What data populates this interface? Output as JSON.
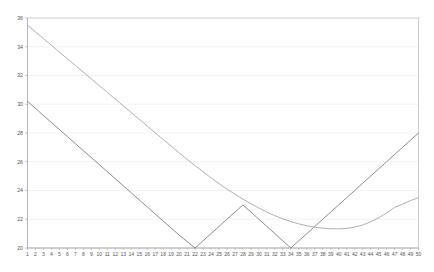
{
  "chart_data": {
    "type": "line",
    "title": "",
    "subtitle": "",
    "xlabel": "",
    "ylabel": "",
    "xlim": [
      1,
      50
    ],
    "ylim": [
      20,
      36
    ],
    "grid": true,
    "legend": "none",
    "background_color": "#ffffff",
    "frame_color": "#c8c8c8",
    "gridline_color": "#e9e9e9",
    "y_ticks": [
      20,
      22,
      24,
      26,
      28,
      30,
      32,
      34,
      36
    ],
    "y_tick_labels": [
      "20",
      "22",
      "24",
      "26",
      "28",
      "30",
      "32",
      "34",
      "36"
    ],
    "x_ticks": [
      1,
      2,
      3,
      4,
      5,
      6,
      7,
      8,
      9,
      10,
      11,
      12,
      13,
      14,
      15,
      16,
      17,
      18,
      19,
      20,
      21,
      22,
      23,
      24,
      25,
      26,
      27,
      28,
      29,
      30,
      31,
      32,
      33,
      34,
      35,
      36,
      37,
      38,
      39,
      40,
      41,
      42,
      43,
      44,
      45,
      46,
      47,
      48,
      49,
      50
    ],
    "x_tick_labels": [
      "1",
      "2",
      "3",
      "4",
      "5",
      "6",
      "7",
      "8",
      "9",
      "10",
      "11",
      "12",
      "13",
      "14",
      "15",
      "16",
      "17",
      "18",
      "19",
      "20",
      "21",
      "22",
      "23",
      "24",
      "25",
      "26",
      "27",
      "28",
      "29",
      "30",
      "31",
      "32",
      "33",
      "34",
      "35",
      "36",
      "37",
      "38",
      "39",
      "40",
      "41",
      "42",
      "43",
      "44",
      "45",
      "46",
      "47",
      "48",
      "49",
      "50"
    ],
    "x": [
      1,
      2,
      3,
      4,
      5,
      6,
      7,
      8,
      9,
      10,
      11,
      12,
      13,
      14,
      15,
      16,
      17,
      18,
      19,
      20,
      21,
      22,
      23,
      24,
      25,
      26,
      27,
      28,
      29,
      30,
      31,
      32,
      33,
      34,
      35,
      36,
      37,
      38,
      39,
      40,
      41,
      42,
      43,
      44,
      45,
      46,
      47,
      48,
      49,
      50
    ],
    "series": [
      {
        "name": "series-1",
        "color": "#6f6f6f",
        "width": 0.8,
        "values": [
          30.2,
          29.71,
          29.22,
          28.73,
          28.24,
          27.75,
          27.26,
          26.77,
          26.29,
          25.8,
          25.31,
          24.82,
          24.33,
          23.84,
          23.35,
          22.86,
          22.37,
          21.88,
          21.39,
          20.9,
          20.45,
          20.0,
          20.5,
          21.0,
          21.5,
          22.0,
          22.5,
          23.0,
          22.5,
          22.0,
          21.5,
          21.0,
          20.5,
          20.0,
          20.5,
          21.0,
          21.5,
          22.0,
          22.5,
          23.0,
          23.5,
          24.0,
          24.5,
          25.0,
          25.5,
          26.0,
          26.5,
          27.0,
          27.5,
          28.0
        ]
      },
      {
        "name": "series-2",
        "color": "#9a9a9a",
        "width": 0.8,
        "values": [
          35.5,
          35.03,
          34.57,
          34.1,
          33.63,
          33.16,
          32.7,
          32.23,
          31.76,
          31.29,
          30.83,
          30.36,
          29.89,
          29.42,
          28.96,
          28.49,
          28.02,
          27.55,
          27.09,
          26.62,
          26.17,
          25.73,
          25.3,
          24.88,
          24.48,
          24.1,
          23.74,
          23.4,
          23.08,
          22.78,
          22.5,
          22.25,
          22.03,
          21.84,
          21.68,
          21.55,
          21.45,
          21.38,
          21.34,
          21.33,
          21.36,
          21.45,
          21.6,
          21.82,
          22.1,
          22.44,
          22.83,
          23.05,
          23.3,
          23.5
        ]
      }
    ]
  }
}
